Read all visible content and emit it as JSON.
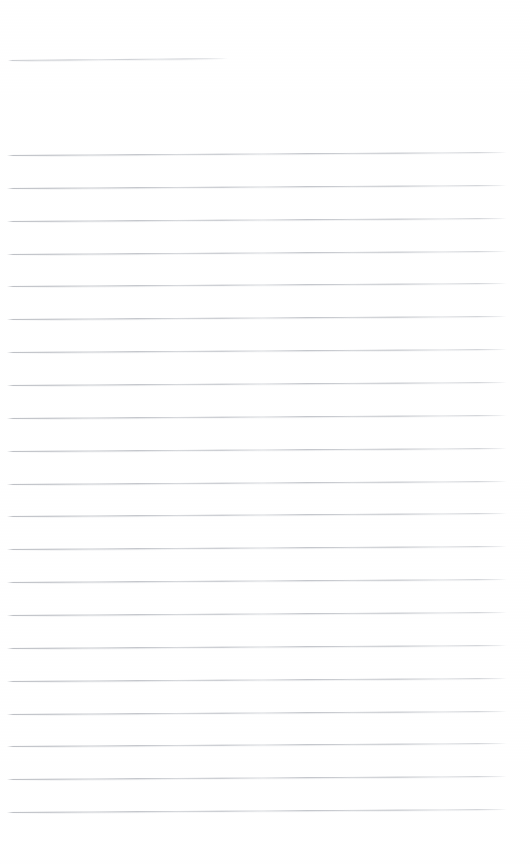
{
  "document": {
    "kind": "scanned-lined-page",
    "page_width": 530,
    "page_height": 864,
    "background_color": "#ffffff",
    "rule_color": "#c0c3c9",
    "visible_text": "",
    "note": ""
  },
  "top_rule": {
    "name": "short-rule",
    "x_start": 8,
    "x_end": 228,
    "y_left": 60,
    "y_right": 58,
    "thickness": 1
  },
  "body_rules": {
    "count": 21,
    "x_start": 7,
    "x_end": 507,
    "first_y_left": 155,
    "spacing": 32.85,
    "slant_rise": 3,
    "thickness": 1,
    "lines": [
      {
        "index": 1,
        "y_left": 155.0,
        "y_right": 152.0
      },
      {
        "index": 2,
        "y_left": 187.9,
        "y_right": 184.9
      },
      {
        "index": 3,
        "y_left": 220.7,
        "y_right": 217.7
      },
      {
        "index": 4,
        "y_left": 253.6,
        "y_right": 250.6
      },
      {
        "index": 5,
        "y_left": 286.4,
        "y_right": 283.4
      },
      {
        "index": 6,
        "y_left": 319.3,
        "y_right": 316.3
      },
      {
        "index": 7,
        "y_left": 352.1,
        "y_right": 349.1
      },
      {
        "index": 8,
        "y_left": 385.0,
        "y_right": 382.0
      },
      {
        "index": 9,
        "y_left": 417.8,
        "y_right": 414.8
      },
      {
        "index": 10,
        "y_left": 450.7,
        "y_right": 447.7
      },
      {
        "index": 11,
        "y_left": 483.5,
        "y_right": 480.5
      },
      {
        "index": 12,
        "y_left": 516.4,
        "y_right": 513.4
      },
      {
        "index": 13,
        "y_left": 549.2,
        "y_right": 546.2
      },
      {
        "index": 14,
        "y_left": 582.1,
        "y_right": 579.1
      },
      {
        "index": 15,
        "y_left": 614.9,
        "y_right": 611.9
      },
      {
        "index": 16,
        "y_left": 647.8,
        "y_right": 644.8
      },
      {
        "index": 17,
        "y_left": 680.6,
        "y_right": 677.6
      },
      {
        "index": 18,
        "y_left": 713.5,
        "y_right": 710.5
      },
      {
        "index": 19,
        "y_left": 746.3,
        "y_right": 743.3
      },
      {
        "index": 20,
        "y_left": 779.2,
        "y_right": 776.2
      },
      {
        "index": 21,
        "y_left": 812.0,
        "y_right": 809.0
      }
    ]
  },
  "margins": {
    "top_blank_height": 52,
    "gap_after_short_rule": 90,
    "bottom_blank_height": 50
  }
}
